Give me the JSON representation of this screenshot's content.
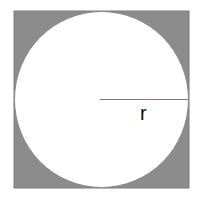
{
  "diagram": {
    "type": "circle-inscribed-in-square",
    "radius_label": "r",
    "colors": {
      "square_fill": "#8c8c8c",
      "square_stroke": "#7a7a7a",
      "circle_fill": "#ffffff",
      "circle_stroke": "#888888",
      "radius_line": "#7a7a7a",
      "label": "#111111"
    }
  }
}
